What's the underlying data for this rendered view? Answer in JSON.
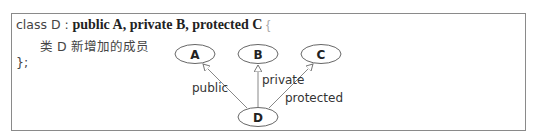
{
  "code": {
    "line1_prefix": "class D :",
    "line1_bases": "public A, private B, protected C",
    "line1_brace": "{",
    "line2": "类 D 新增加的成员",
    "line3": "};"
  },
  "diagram": {
    "nodes": [
      {
        "id": "A",
        "label": "A",
        "cx": 195,
        "cy": 54
      },
      {
        "id": "B",
        "label": "B",
        "cx": 258,
        "cy": 54
      },
      {
        "id": "C",
        "label": "C",
        "cx": 321,
        "cy": 54
      },
      {
        "id": "D",
        "label": "D",
        "cx": 258,
        "cy": 117
      }
    ],
    "edges": [
      {
        "from": "D",
        "to": "A",
        "label": "public"
      },
      {
        "from": "D",
        "to": "B",
        "label": "private"
      },
      {
        "from": "D",
        "to": "C",
        "label": "protected"
      }
    ]
  }
}
